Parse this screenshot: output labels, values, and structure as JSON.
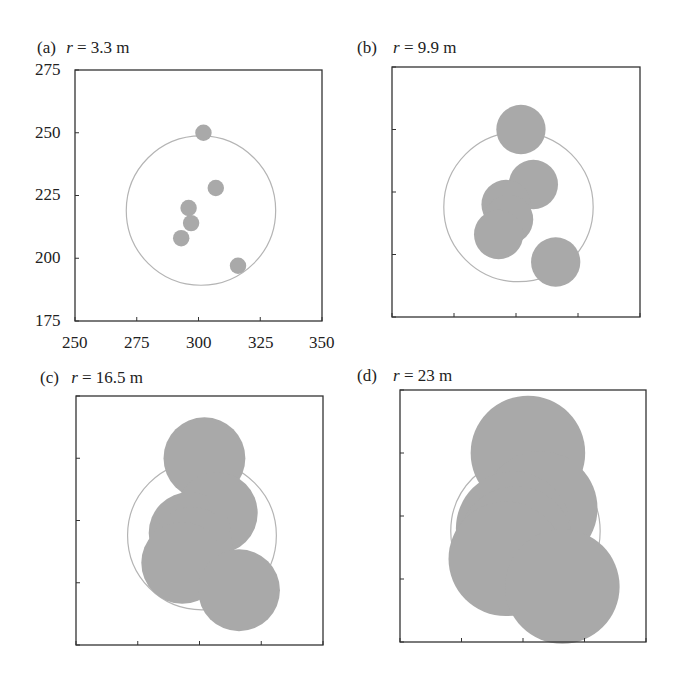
{
  "chart_data": [
    {
      "type": "scatter",
      "panel": "(a)",
      "title": "r = 3.3 m",
      "disc_radius_m": 3.3,
      "xlim": [
        250,
        350
      ],
      "ylim": [
        175,
        275
      ],
      "xticks": [
        250,
        275,
        300,
        325,
        350
      ],
      "yticks": [
        175,
        200,
        225,
        250,
        275
      ],
      "tick_labels_visible": true,
      "reference_circle": {
        "cx": 301,
        "cy": 219,
        "r": 30
      },
      "points": [
        {
          "x": 302,
          "y": 250
        },
        {
          "x": 307,
          "y": 228
        },
        {
          "x": 296,
          "y": 220
        },
        {
          "x": 297,
          "y": 214
        },
        {
          "x": 293,
          "y": 208
        },
        {
          "x": 316,
          "y": 197
        }
      ]
    },
    {
      "type": "scatter",
      "panel": "(b)",
      "title": "r = 9.9 m",
      "disc_radius_m": 9.9,
      "xlim": [
        250,
        350
      ],
      "ylim": [
        175,
        275
      ],
      "tick_labels_visible": false,
      "reference_circle": {
        "cx": 301,
        "cy": 219,
        "r": 30
      },
      "points": [
        {
          "x": 302,
          "y": 250
        },
        {
          "x": 307,
          "y": 228
        },
        {
          "x": 296,
          "y": 220
        },
        {
          "x": 297,
          "y": 214
        },
        {
          "x": 293,
          "y": 208
        },
        {
          "x": 316,
          "y": 197
        }
      ]
    },
    {
      "type": "scatter",
      "panel": "(c)",
      "title": "r = 16.5 m",
      "disc_radius_m": 16.5,
      "xlim": [
        250,
        350
      ],
      "ylim": [
        175,
        275
      ],
      "tick_labels_visible": false,
      "reference_circle": {
        "cx": 301,
        "cy": 219,
        "r": 30
      },
      "points": [
        {
          "x": 302,
          "y": 250
        },
        {
          "x": 307,
          "y": 228
        },
        {
          "x": 296,
          "y": 220
        },
        {
          "x": 297,
          "y": 214
        },
        {
          "x": 293,
          "y": 208
        },
        {
          "x": 316,
          "y": 197
        }
      ]
    },
    {
      "type": "scatter",
      "panel": "(d)",
      "title": "r = 23 m",
      "disc_radius_m": 23,
      "xlim": [
        250,
        350
      ],
      "ylim": [
        175,
        275
      ],
      "tick_labels_visible": false,
      "reference_circle": {
        "cx": 301,
        "cy": 219,
        "r": 30
      },
      "points": [
        {
          "x": 302,
          "y": 250
        },
        {
          "x": 307,
          "y": 228
        },
        {
          "x": 296,
          "y": 220
        },
        {
          "x": 297,
          "y": 214
        },
        {
          "x": 293,
          "y": 208
        },
        {
          "x": 316,
          "y": 197
        }
      ]
    }
  ],
  "panels": [
    {
      "letter": "(a)",
      "r_symbol": "r",
      "r_value": " = 3.3 m"
    },
    {
      "letter": "(b)",
      "r_symbol": "r",
      "r_value": " = 9.9 m"
    },
    {
      "letter": "(c)",
      "r_symbol": "r",
      "r_value": " = 16.5 m"
    },
    {
      "letter": "(d)",
      "r_symbol": "r",
      "r_value": " = 23 m"
    }
  ],
  "axes_a": {
    "xtick_labels": [
      "250",
      "275",
      "300",
      "325",
      "350"
    ],
    "ytick_labels": [
      "275",
      "250",
      "225",
      "200",
      "175"
    ]
  },
  "colors": {
    "disc_fill": "#a9a9a9",
    "reference_circle": "#b4b4b4",
    "frame": "#333333"
  }
}
